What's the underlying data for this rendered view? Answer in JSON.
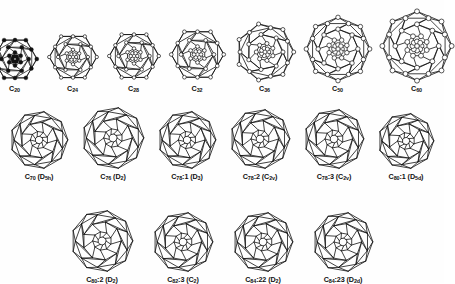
{
  "figure": {
    "background_color": "#fefefe",
    "line_color": "#111111",
    "label_color": "#101010",
    "vertex_fill_open": "#ffffff",
    "vertex_fill_solid": "#111111"
  },
  "rows": [
    {
      "row_index": 1,
      "cells": [
        {
          "formula": "C",
          "count": "20",
          "symmetry": "",
          "isomer": "",
          "label": "C20",
          "vertex_style": "solid",
          "diameter": 44,
          "carbon_atoms": 20
        },
        {
          "formula": "C",
          "count": "24",
          "symmetry": "",
          "isomer": "",
          "label": "C24",
          "vertex_style": "open",
          "diameter": 48,
          "carbon_atoms": 24
        },
        {
          "formula": "C",
          "count": "28",
          "symmetry": "",
          "isomer": "",
          "label": "C28",
          "vertex_style": "open",
          "diameter": 50,
          "carbon_atoms": 28
        },
        {
          "formula": "C",
          "count": "32",
          "symmetry": "",
          "isomer": "",
          "label": "C32",
          "vertex_style": "open",
          "diameter": 53,
          "carbon_atoms": 32
        },
        {
          "formula": "C",
          "count": "36",
          "symmetry": "",
          "isomer": "",
          "label": "C36",
          "vertex_style": "open",
          "diameter": 58,
          "carbon_atoms": 36
        },
        {
          "formula": "C",
          "count": "50",
          "symmetry": "",
          "isomer": "",
          "label": "C50",
          "vertex_style": "open",
          "diameter": 64,
          "carbon_atoms": 50
        },
        {
          "formula": "C",
          "count": "60",
          "symmetry": "",
          "isomer": "",
          "label": "C60",
          "vertex_style": "open",
          "diameter": 70,
          "carbon_atoms": 60
        }
      ]
    },
    {
      "row_index": 2,
      "cells": [
        {
          "formula": "C",
          "count": "70",
          "symmetry": "D5h",
          "isomer": "",
          "label": "C70 (D5h)",
          "vertex_style": "line",
          "diameter": 58,
          "carbon_atoms": 70
        },
        {
          "formula": "C",
          "count": "76",
          "symmetry": "D2",
          "isomer": "",
          "label": "C76 (D2)",
          "vertex_style": "line",
          "diameter": 62,
          "carbon_atoms": 76
        },
        {
          "formula": "C",
          "count": "78",
          "symmetry": "D3",
          "isomer": "1",
          "label": "C78:1 (D3)",
          "vertex_style": "line",
          "diameter": 58,
          "carbon_atoms": 78
        },
        {
          "formula": "C",
          "count": "78",
          "symmetry": "C2v",
          "isomer": "2",
          "label": "C78:2 (C2v)",
          "vertex_style": "line",
          "diameter": 60,
          "carbon_atoms": 78
        },
        {
          "formula": "C",
          "count": "78",
          "symmetry": "C2v",
          "isomer": "3",
          "label": "C78:3 (C2v)",
          "vertex_style": "line",
          "diameter": 60,
          "carbon_atoms": 78
        },
        {
          "formula": "C",
          "count": "80",
          "symmetry": "D5d",
          "isomer": "1",
          "label": "C80:1 (D5d)",
          "vertex_style": "line",
          "diameter": 56,
          "carbon_atoms": 80
        }
      ]
    },
    {
      "row_index": 3,
      "cells": [
        {
          "formula": "C",
          "count": "80",
          "symmetry": "D2",
          "isomer": "2",
          "label": "C80:2 (D2)",
          "vertex_style": "line",
          "diameter": 62,
          "carbon_atoms": 80
        },
        {
          "formula": "C",
          "count": "82",
          "symmetry": "C2",
          "isomer": "3",
          "label": "C82:3 (C2)",
          "vertex_style": "line",
          "diameter": 60,
          "carbon_atoms": 82
        },
        {
          "formula": "C",
          "count": "84",
          "symmetry": "D2",
          "isomer": "22",
          "label": "C84:22 (D2)",
          "vertex_style": "line",
          "diameter": 60,
          "carbon_atoms": 84
        },
        {
          "formula": "C",
          "count": "84",
          "symmetry": "D2d",
          "isomer": "23",
          "label": "C84:23 (D2d)",
          "vertex_style": "line",
          "diameter": 60,
          "carbon_atoms": 84
        }
      ]
    }
  ]
}
